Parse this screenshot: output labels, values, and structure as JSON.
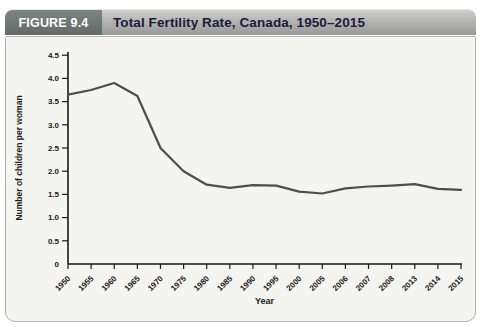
{
  "header": {
    "figure_label": "FIGURE 9.4",
    "title": "Total Fertility Rate, Canada, 1950–2015"
  },
  "chart_data": {
    "type": "line",
    "title": "Total Fertility Rate, Canada, 1950–2015",
    "xlabel": "Year",
    "ylabel": "Number of children per woman",
    "categories": [
      "1950",
      "1955",
      "1960",
      "1965",
      "1970",
      "1975",
      "1980",
      "1985",
      "1990",
      "1995",
      "2000",
      "2005",
      "2006",
      "2007",
      "2008",
      "2013",
      "2014",
      "2015"
    ],
    "values": [
      3.65,
      3.75,
      3.9,
      3.62,
      2.5,
      2.0,
      1.71,
      1.64,
      1.7,
      1.69,
      1.56,
      1.52,
      1.63,
      1.67,
      1.69,
      1.72,
      1.62,
      1.6
    ],
    "ylim": [
      0,
      4.5
    ],
    "ytick_step": 0.5,
    "ytick_labels": [
      "0",
      "0.5",
      "1.0",
      "1.5",
      "2.0",
      "2.5",
      "3.0",
      "3.5",
      "4.0",
      "4.5"
    ],
    "grid": false,
    "legend": "none",
    "line_color": "#4e4e4e",
    "axis_color": "#1a1a1a",
    "plot_background": "#f4f4f1"
  },
  "colors": {
    "badge_background": "#6d7674",
    "badge_text": "#ffffff",
    "header_strip": "#b4b5b2",
    "title_text": "#1b1b3a",
    "panel_border": "#b1b1ad"
  }
}
